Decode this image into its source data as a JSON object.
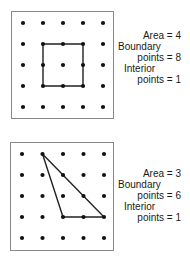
{
  "figures": [
    {
      "id": "square",
      "grid": {
        "cols": 5,
        "rows": 5
      },
      "polygon": [
        [
          1,
          1
        ],
        [
          3,
          1
        ],
        [
          3,
          3
        ],
        [
          1,
          3
        ]
      ],
      "caption": {
        "area_line": "Area = 4",
        "boundary_label": "Boundary",
        "boundary_value": "points = 8",
        "interior_label": "Interior",
        "interior_value": "points = 1"
      },
      "values": {
        "area": 4,
        "boundary_points": 8,
        "interior_points": 1
      }
    },
    {
      "id": "triangle",
      "grid": {
        "cols": 5,
        "rows": 5
      },
      "polygon": [
        [
          1,
          0
        ],
        [
          4,
          3
        ],
        [
          2,
          3
        ]
      ],
      "caption": {
        "area_line": "Area = 3",
        "boundary_label": "Boundary",
        "boundary_value": "points = 6",
        "interior_label": "Interior",
        "interior_value": "points = 1"
      },
      "values": {
        "area": 3,
        "boundary_points": 6,
        "interior_points": 1
      }
    }
  ],
  "colors": {
    "dot": "#111111",
    "line": "#222222",
    "frame": "#888888"
  }
}
